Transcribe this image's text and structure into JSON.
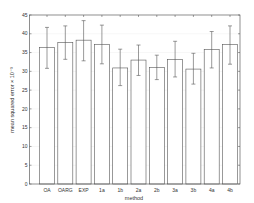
{
  "chart_data": {
    "type": "bar",
    "title": "",
    "xlabel": "method",
    "ylabel": "mean squared error × 10⁻³",
    "ylim": [
      0,
      45
    ],
    "yticks": [
      0,
      5,
      10,
      15,
      20,
      25,
      30,
      35,
      40,
      45
    ],
    "grid": true,
    "legend": null,
    "categories": [
      "OA",
      "OARG",
      "EXP",
      "1a",
      "1b",
      "2a",
      "2b",
      "3a",
      "3b",
      "4a",
      "4b"
    ],
    "values": [
      36.4,
      37.7,
      38.3,
      37.2,
      30.9,
      33.0,
      31.0,
      33.2,
      30.6,
      35.8,
      37.1
    ],
    "error_low": [
      30.8,
      33.2,
      32.8,
      32.0,
      26.2,
      28.9,
      27.8,
      28.5,
      26.6,
      30.9,
      31.9
    ],
    "error_high": [
      41.7,
      42.1,
      43.5,
      42.3,
      35.9,
      37.0,
      34.3,
      38.0,
      34.8,
      40.6,
      42.1
    ]
  },
  "colors": {
    "bar_fill": "#ffffff",
    "bar_stroke": "#555555",
    "axis": "#444444",
    "grid": "#dddddd"
  }
}
